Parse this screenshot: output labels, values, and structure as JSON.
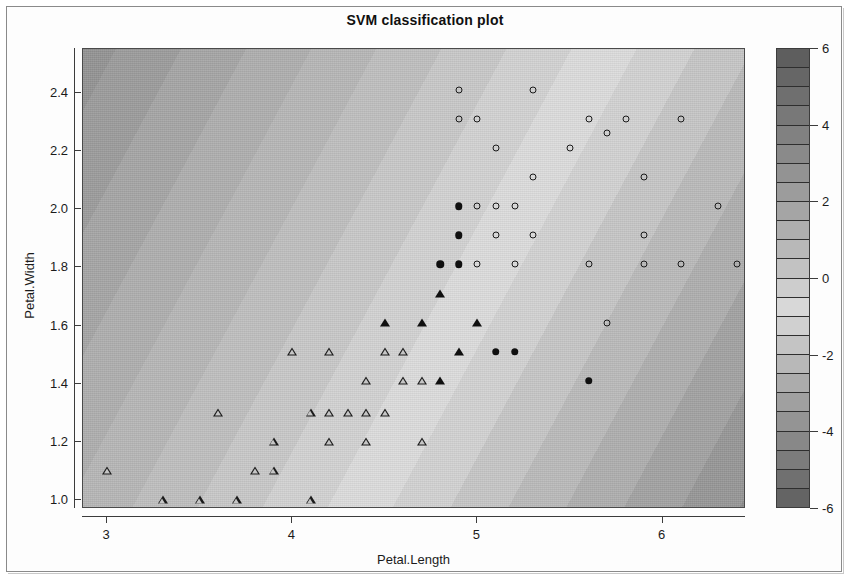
{
  "chart_data": {
    "type": "scatter",
    "title": "SVM classification plot",
    "xlabel": "Petal.Length",
    "ylabel": "Petal.Width",
    "xlim": [
      2.87,
      6.45
    ],
    "ylim": [
      0.97,
      2.55
    ],
    "xticks": [
      3,
      4,
      5,
      6
    ],
    "xtick_labels": [
      "3",
      "4",
      "5",
      "6"
    ],
    "yticks": [
      1.0,
      1.2,
      1.4,
      1.6,
      1.8,
      2.0,
      2.2,
      2.4
    ],
    "ytick_labels": [
      "1.0",
      "1.2",
      "1.4",
      "1.6",
      "1.8",
      "2.0",
      "2.2",
      "2.4"
    ],
    "grid": false,
    "legend_position": "right-colorbar",
    "colorbar": {
      "label": "",
      "min": -6,
      "max": 6,
      "ticks": [
        6,
        4,
        2,
        0,
        -2,
        -4,
        -6
      ],
      "tick_labels": [
        "6",
        "4",
        "2",
        "0",
        "-2",
        "-4",
        "-6"
      ],
      "band_count": 24,
      "colors": [
        "#5e5e5e",
        "#666666",
        "#6f6f6f",
        "#787878",
        "#818181",
        "#8a8a8a",
        "#939393",
        "#9c9c9c",
        "#a5a5a5",
        "#aeaeae",
        "#b8b8b8",
        "#c2c2c2",
        "#cdcdcd",
        "#d8d8d8",
        "#d0d0d0",
        "#c4c4c4",
        "#b8b8b8",
        "#acacac",
        "#a0a0a0",
        "#949494",
        "#888888",
        "#7c7c7c",
        "#707070",
        "#646464"
      ]
    },
    "surface": {
      "description": "Diagonal banded SVM decision-value surface, light near boundary, dark at extremes",
      "angle_deg": 118
    },
    "series": [
      {
        "name": "versicolor (open triangle)",
        "marker": "triangle-open",
        "color": "#1b1b1b",
        "points": [
          [
            3.0,
            1.1
          ],
          [
            3.3,
            1.0
          ],
          [
            3.5,
            1.0
          ],
          [
            3.7,
            1.0
          ],
          [
            4.1,
            1.0
          ],
          [
            3.8,
            1.1
          ],
          [
            3.9,
            1.1
          ],
          [
            3.9,
            1.2
          ],
          [
            4.2,
            1.2
          ],
          [
            4.4,
            1.2
          ],
          [
            4.7,
            1.2
          ],
          [
            3.6,
            1.3
          ],
          [
            4.1,
            1.3
          ],
          [
            4.2,
            1.3
          ],
          [
            4.3,
            1.3
          ],
          [
            4.4,
            1.3
          ],
          [
            4.5,
            1.3
          ],
          [
            4.4,
            1.41
          ],
          [
            4.6,
            1.41
          ],
          [
            4.7,
            1.41
          ],
          [
            4.2,
            1.51
          ],
          [
            4.5,
            1.51
          ],
          [
            4.6,
            1.51
          ],
          [
            4.0,
            1.51
          ]
        ]
      },
      {
        "name": "versicolor support vectors (filled triangle)",
        "marker": "triangle-filled",
        "color": "#101010",
        "points": [
          [
            4.5,
            1.61
          ],
          [
            4.7,
            1.61
          ],
          [
            5.0,
            1.61
          ],
          [
            4.8,
            1.71
          ],
          [
            4.9,
            1.51
          ],
          [
            4.8,
            1.41
          ]
        ]
      },
      {
        "name": "virginica (open circle)",
        "marker": "circle-open",
        "color": "#1b1b1b",
        "points": [
          [
            4.9,
            2.41
          ],
          [
            5.3,
            2.41
          ],
          [
            4.9,
            2.31
          ],
          [
            5.0,
            2.31
          ],
          [
            5.6,
            2.31
          ],
          [
            5.8,
            2.31
          ],
          [
            6.1,
            2.31
          ],
          [
            5.7,
            2.26
          ],
          [
            5.1,
            2.21
          ],
          [
            5.5,
            2.21
          ],
          [
            5.3,
            2.11
          ],
          [
            5.9,
            2.11
          ],
          [
            6.6,
            2.11
          ],
          [
            5.0,
            2.01
          ],
          [
            5.1,
            2.01
          ],
          [
            5.2,
            2.01
          ],
          [
            6.3,
            2.01
          ],
          [
            6.7,
            2.01
          ],
          [
            5.1,
            1.91
          ],
          [
            5.3,
            1.91
          ],
          [
            5.9,
            1.91
          ],
          [
            5.0,
            1.81
          ],
          [
            5.2,
            1.81
          ],
          [
            5.6,
            1.81
          ],
          [
            5.9,
            1.81
          ],
          [
            6.1,
            1.81
          ],
          [
            6.4,
            1.81
          ],
          [
            5.7,
            1.61
          ]
        ]
      },
      {
        "name": "virginica support vectors (filled circle)",
        "marker": "circle-filled",
        "color": "#101010",
        "points": [
          [
            4.9,
            2.01
          ],
          [
            4.9,
            1.91
          ],
          [
            4.8,
            1.81
          ],
          [
            4.9,
            1.81
          ],
          [
            5.1,
            1.51
          ],
          [
            5.2,
            1.51
          ],
          [
            5.6,
            1.41
          ]
        ]
      }
    ]
  }
}
